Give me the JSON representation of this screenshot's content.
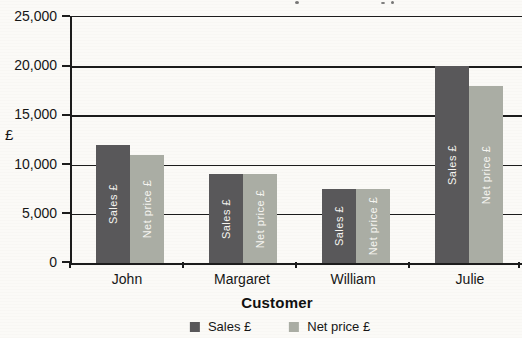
{
  "chart_data": {
    "type": "bar",
    "title": "",
    "categories": [
      "John",
      "Margaret",
      "William",
      "Julie"
    ],
    "series": [
      {
        "name": "Sales £",
        "color": "#59585a",
        "values": [
          12000,
          9000,
          7500,
          20000
        ]
      },
      {
        "name": "Net price £",
        "color": "#aaada4",
        "values": [
          11000,
          9000,
          7500,
          18000
        ]
      }
    ],
    "xlabel": "Customer",
    "ylabel": "£",
    "ylim": [
      0,
      25000
    ],
    "ytick_step": 5000,
    "ytick_labels": [
      "0",
      "5,000",
      "10,000",
      "15,000",
      "20,000",
      "25,000"
    ],
    "grid": true,
    "legend_position": "bottom",
    "bar_labels": "series name, rotated 90° CCW, white, centered in bar",
    "axis_color": "#1c1c1c"
  },
  "legend": {
    "items": [
      {
        "label": "Sales £"
      },
      {
        "label": "Net price £"
      }
    ]
  }
}
